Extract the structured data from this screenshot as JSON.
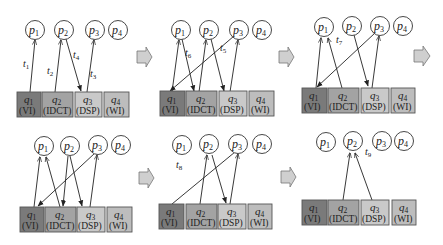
{
  "figure": {
    "colors": {
      "q1": "#7a7a7a",
      "q2": "#a3a3a3",
      "q3": "#c9c9c9",
      "q4": "#bdbdbd",
      "flow_arrow": "#cfcfcf",
      "edge": "#222222"
    },
    "processors": [
      {
        "id": "p1",
        "label": "p",
        "sub": "1"
      },
      {
        "id": "p2",
        "label": "p",
        "sub": "2"
      },
      {
        "id": "p3",
        "label": "p",
        "sub": "3"
      },
      {
        "id": "p4",
        "label": "p",
        "sub": "4"
      }
    ],
    "queues": [
      {
        "id": "q1",
        "label": "q",
        "sub": "1",
        "role": "(VI)"
      },
      {
        "id": "q2",
        "label": "q",
        "sub": "2",
        "role": "(IDCT)"
      },
      {
        "id": "q3",
        "label": "q",
        "sub": "3",
        "role": "(DSP)"
      },
      {
        "id": "q4",
        "label": "q",
        "sub": "4",
        "role": "(WI)"
      }
    ],
    "panels": [
      {
        "index": 1,
        "edges": [
          {
            "from": "q1",
            "to": "p1",
            "label": "t",
            "sub": "1"
          },
          {
            "from": "q2",
            "to": "p2",
            "label": "t",
            "sub": "2"
          },
          {
            "from": "p2",
            "to": "q3",
            "label": "t",
            "sub": "4"
          },
          {
            "from": "q3",
            "to": "p3",
            "label": "t",
            "sub": "3"
          }
        ]
      },
      {
        "index": 2,
        "edges": [
          {
            "from": "q1",
            "to": "p1"
          },
          {
            "from": "p1",
            "to": "q2",
            "label": "t",
            "sub": "6"
          },
          {
            "from": "q2",
            "to": "p2"
          },
          {
            "from": "p2",
            "to": "q3"
          },
          {
            "from": "p3",
            "to": "q1",
            "label": "t",
            "sub": "5"
          },
          {
            "from": "q3",
            "to": "p3"
          }
        ]
      },
      {
        "index": 3,
        "edges": [
          {
            "from": "q1",
            "to": "p1"
          },
          {
            "from": "q2",
            "to": "p1",
            "label": "t",
            "sub": "7"
          },
          {
            "from": "p2",
            "to": "q3"
          },
          {
            "from": "p3",
            "to": "q1"
          },
          {
            "from": "q3",
            "to": "p3"
          }
        ]
      },
      {
        "index": 4,
        "edges": [
          {
            "from": "q1",
            "to": "p1"
          },
          {
            "from": "q2",
            "to": "p1"
          },
          {
            "from": "p2",
            "to": "q2"
          },
          {
            "from": "p2",
            "to": "q3"
          },
          {
            "from": "p3",
            "to": "q1"
          },
          {
            "from": "q3",
            "to": "p3"
          }
        ]
      },
      {
        "index": 5,
        "note_label": {
          "label": "t",
          "sub": "8"
        },
        "edges": [
          {
            "from": "q1",
            "to": "p3"
          },
          {
            "from": "q2",
            "to": "p2"
          },
          {
            "from": "p2",
            "to": "q3"
          },
          {
            "from": "q3",
            "to": "p3"
          }
        ]
      },
      {
        "index": 6,
        "edges": [
          {
            "from": "q2",
            "to": "p2"
          },
          {
            "from": "q3",
            "to": "p2",
            "label": "t",
            "sub": "9"
          }
        ]
      }
    ]
  }
}
